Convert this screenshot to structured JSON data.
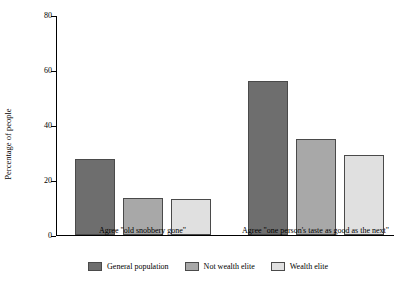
{
  "chart_data": {
    "type": "bar",
    "title": "",
    "subtitle": "",
    "xlabel": "",
    "ylabel": "Percentage of people",
    "ylim": [
      0,
      80
    ],
    "yticks": [
      0,
      20,
      40,
      60,
      80
    ],
    "grid": false,
    "legend_position": "bottom",
    "categories": [
      "Agree \"old snobbery gone\"",
      "Agree \"one person's taste as good as the next\""
    ],
    "series": [
      {
        "name": "General population",
        "color": "#6e6e6e",
        "values": [
          27.5,
          56
        ]
      },
      {
        "name": "Not wealth elite",
        "color": "#a8a8a8",
        "values": [
          13.5,
          35
        ]
      },
      {
        "name": "Wealth elite",
        "color": "#e0e0e0",
        "values": [
          13,
          29
        ]
      }
    ]
  }
}
